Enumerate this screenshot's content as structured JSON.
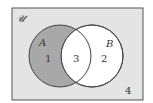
{
  "diagram": {
    "type": "venn",
    "universe_label": "𝒰",
    "sets": [
      {
        "name": "A",
        "label": "A"
      },
      {
        "name": "B",
        "label": "B"
      }
    ],
    "regions": {
      "a_only": "1",
      "b_only": "2",
      "a_and_b": "3",
      "outside": "4"
    },
    "shaded_region": "A only (A minus B)",
    "colors": {
      "universe_fill": "#e4e4e4",
      "shade_fill": "#a8a8a8",
      "circle_fill": "#ffffff",
      "stroke": "#444444"
    }
  }
}
